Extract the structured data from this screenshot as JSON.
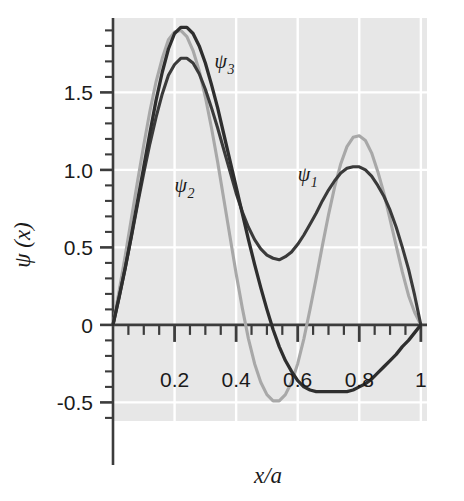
{
  "chart_data": {
    "type": "line",
    "title": "",
    "xlabel": "x/a",
    "ylabel": "ψ(x)",
    "xlim": [
      0,
      1.02
    ],
    "ylim": [
      -0.62,
      1.98
    ],
    "grid": true,
    "grid_color": "#ffffff",
    "plot_background": "#e7e7e7",
    "legend_position": "inline-annotations",
    "x_ticks_major": [
      0.2,
      0.4,
      0.6,
      0.8,
      1
    ],
    "x_tick_labels": [
      "0.2",
      "0.4",
      "0.6",
      "0.8",
      "1"
    ],
    "x_ticks_minor_step": 0.05,
    "y_ticks_major": [
      -0.5,
      0,
      0.5,
      1.0,
      1.5
    ],
    "y_tick_labels": [
      "-0.5",
      "0",
      "0.5",
      "1.0",
      "1.5"
    ],
    "y_ticks_minor_step": 0.1,
    "annotations": [
      {
        "text": "ψ",
        "sub": "3",
        "x": 0.33,
        "y": 1.66,
        "color": "#2b2b2b"
      },
      {
        "text": "ψ",
        "sub": "2",
        "x": 0.2,
        "y": 0.86,
        "color": "#8c8c8c"
      },
      {
        "text": "ψ",
        "sub": "1",
        "x": 0.6,
        "y": 0.93,
        "color": "#2b2b2b"
      }
    ],
    "series": [
      {
        "name": "ψ1",
        "label": "ψ₁",
        "color": "#3a3a3a",
        "width": 3.1,
        "description": "Superposition with maxima near x=0.24 (1.72) and x=0.78 (1.02), local minimum near x=0.52 (0.42)",
        "x": [
          0.0,
          0.02,
          0.04,
          0.06,
          0.08,
          0.1,
          0.12,
          0.14,
          0.16,
          0.18,
          0.2,
          0.22,
          0.24,
          0.26,
          0.28,
          0.3,
          0.32,
          0.34,
          0.36,
          0.38,
          0.4,
          0.42,
          0.44,
          0.46,
          0.48,
          0.5,
          0.52,
          0.54,
          0.56,
          0.58,
          0.6,
          0.62,
          0.64,
          0.66,
          0.68,
          0.7,
          0.72,
          0.74,
          0.76,
          0.78,
          0.8,
          0.82,
          0.84,
          0.86,
          0.88,
          0.9,
          0.92,
          0.94,
          0.96,
          0.98,
          1.0
        ],
        "y": [
          0.0,
          0.18,
          0.37,
          0.57,
          0.78,
          0.98,
          1.17,
          1.34,
          1.49,
          1.61,
          1.68,
          1.72,
          1.72,
          1.69,
          1.62,
          1.52,
          1.4,
          1.27,
          1.13,
          0.99,
          0.85,
          0.73,
          0.63,
          0.55,
          0.49,
          0.45,
          0.43,
          0.42,
          0.44,
          0.47,
          0.52,
          0.58,
          0.65,
          0.72,
          0.8,
          0.87,
          0.93,
          0.98,
          1.01,
          1.02,
          1.02,
          1.0,
          0.96,
          0.9,
          0.83,
          0.74,
          0.63,
          0.5,
          0.36,
          0.19,
          0.0
        ]
      },
      {
        "name": "ψ2",
        "label": "ψ₂",
        "color": "#a8a8a8",
        "width": 3.1,
        "description": "Two-lobed wave: max 1.90 near x=0.22, min -0.49 near x=0.55, second max 1.22 near x=0.80",
        "x": [
          0.0,
          0.02,
          0.04,
          0.06,
          0.08,
          0.1,
          0.12,
          0.14,
          0.16,
          0.18,
          0.2,
          0.22,
          0.24,
          0.26,
          0.28,
          0.3,
          0.32,
          0.34,
          0.36,
          0.38,
          0.4,
          0.42,
          0.44,
          0.46,
          0.48,
          0.5,
          0.52,
          0.54,
          0.56,
          0.58,
          0.6,
          0.62,
          0.64,
          0.66,
          0.68,
          0.7,
          0.72,
          0.74,
          0.76,
          0.78,
          0.8,
          0.82,
          0.84,
          0.86,
          0.88,
          0.9,
          0.92,
          0.94,
          0.96,
          0.98,
          1.0
        ],
        "y": [
          0.0,
          0.22,
          0.45,
          0.69,
          0.93,
          1.16,
          1.38,
          1.57,
          1.72,
          1.84,
          1.89,
          1.9,
          1.86,
          1.77,
          1.64,
          1.47,
          1.27,
          1.05,
          0.81,
          0.57,
          0.33,
          0.11,
          -0.09,
          -0.25,
          -0.37,
          -0.45,
          -0.49,
          -0.49,
          -0.45,
          -0.37,
          -0.25,
          -0.09,
          0.1,
          0.3,
          0.51,
          0.71,
          0.89,
          1.04,
          1.15,
          1.21,
          1.22,
          1.19,
          1.11,
          0.99,
          0.85,
          0.68,
          0.51,
          0.34,
          0.19,
          0.08,
          0.0
        ]
      },
      {
        "name": "ψ3",
        "label": "ψ₃",
        "color": "#2e2e2e",
        "width": 3.3,
        "description": "Three-lobed wave: max 1.92 near x=0.25, crosses zero near x=0.59, min -0.43 near x=0.76",
        "x": [
          0.0,
          0.02,
          0.04,
          0.06,
          0.08,
          0.1,
          0.12,
          0.14,
          0.16,
          0.18,
          0.2,
          0.22,
          0.24,
          0.26,
          0.28,
          0.3,
          0.32,
          0.34,
          0.36,
          0.38,
          0.4,
          0.42,
          0.44,
          0.46,
          0.48,
          0.5,
          0.52,
          0.54,
          0.56,
          0.58,
          0.6,
          0.62,
          0.64,
          0.66,
          0.68,
          0.7,
          0.72,
          0.74,
          0.76,
          0.78,
          0.8,
          0.82,
          0.84,
          0.86,
          0.88,
          0.9,
          0.92,
          0.94,
          0.96,
          0.98,
          1.0
        ],
        "y": [
          0.0,
          0.18,
          0.37,
          0.58,
          0.8,
          1.02,
          1.24,
          1.45,
          1.63,
          1.78,
          1.88,
          1.92,
          1.92,
          1.88,
          1.8,
          1.69,
          1.55,
          1.4,
          1.23,
          1.06,
          0.89,
          0.72,
          0.55,
          0.39,
          0.24,
          0.1,
          -0.03,
          -0.14,
          -0.23,
          -0.3,
          -0.36,
          -0.4,
          -0.42,
          -0.43,
          -0.43,
          -0.43,
          -0.43,
          -0.43,
          -0.43,
          -0.42,
          -0.4,
          -0.38,
          -0.35,
          -0.31,
          -0.27,
          -0.23,
          -0.19,
          -0.14,
          -0.1,
          -0.05,
          0.0
        ]
      }
    ]
  },
  "axes": {
    "y_axis_title": "ψ (x)",
    "x_axis_title": "x/a"
  }
}
